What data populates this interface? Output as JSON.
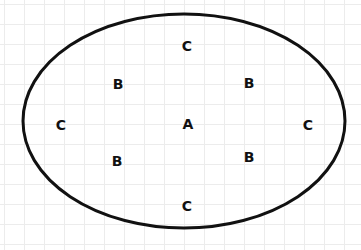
{
  "diagram": {
    "ellipse": {
      "cx": 184,
      "cy": 121,
      "rx": 161,
      "ry": 107,
      "stroke": "#111111",
      "stroke_width": 3
    },
    "labels": [
      {
        "text": "C",
        "x": 187,
        "y": 46
      },
      {
        "text": "B",
        "x": 118,
        "y": 84
      },
      {
        "text": "B",
        "x": 249,
        "y": 83
      },
      {
        "text": "C",
        "x": 61,
        "y": 125
      },
      {
        "text": "A",
        "x": 188,
        "y": 124
      },
      {
        "text": "C",
        "x": 308,
        "y": 125
      },
      {
        "text": "B",
        "x": 117,
        "y": 161
      },
      {
        "text": "B",
        "x": 249,
        "y": 157
      },
      {
        "text": "C",
        "x": 187,
        "y": 206
      }
    ]
  }
}
